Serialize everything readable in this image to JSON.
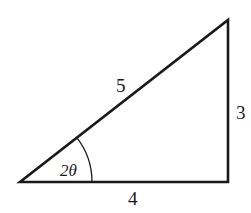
{
  "diagram": {
    "type": "right-triangle",
    "hypotenuse_label": "5",
    "opposite_label": "3",
    "adjacent_label": "4",
    "angle_label": "2θ",
    "stroke_color": "#1a1a1a",
    "background": "#ffffff"
  }
}
